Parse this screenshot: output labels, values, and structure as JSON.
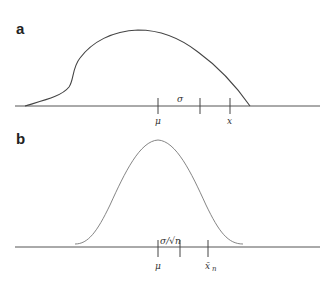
{
  "panels": [
    {
      "label": "a",
      "description": "Skewed population distribution",
      "tick_labels": {
        "mu": "μ",
        "sigma": "σ",
        "x": "x"
      }
    },
    {
      "label": "b",
      "description": "Normal sampling distribution of the mean",
      "tick_labels": {
        "mu": "μ",
        "se": "σ/√n",
        "xbar": "x̄",
        "xbar_sub": "n"
      }
    }
  ],
  "colors": {
    "curve_a": "#444444",
    "curve_b": "#777777",
    "axis": "#555555"
  }
}
